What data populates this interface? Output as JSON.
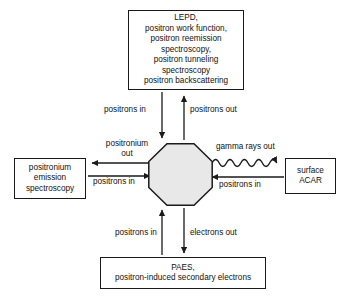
{
  "diagram": {
    "center": {
      "shape": "octagon",
      "label": "",
      "fill": "#e8e8e8",
      "stroke": "#1a1a1a"
    },
    "boxes": {
      "top": {
        "name": "LEPD techniques box",
        "lines": [
          "LEPD,",
          "positron work function,",
          "positron reemission",
          "spectroscopy,",
          "positron tunneling",
          "spectroscopy",
          "positron backscattering"
        ]
      },
      "left": {
        "name": "Positronium emission spectroscopy box",
        "lines": [
          "positronium",
          "emission",
          "spectroscopy"
        ]
      },
      "right": {
        "name": "Surface ACAR box",
        "lines": [
          "surface",
          "ACAR"
        ]
      },
      "bottom": {
        "name": "PAES box",
        "lines": [
          "PAES,",
          "positron-induced secondary electrons"
        ]
      }
    },
    "arrow_labels": {
      "positrons_in_top": "positrons in",
      "positrons_out_top": "positrons out",
      "positronium_out": "positronium\nout",
      "positronium_out_line1": "positronium",
      "positronium_out_line2": "out",
      "positrons_in_left": "positrons in",
      "gamma_rays_out": "gamma rays out",
      "positrons_in_right": "positrons in",
      "positrons_in_bottom": "positrons in",
      "electrons_out_bottom": "electrons out"
    },
    "colors": {
      "stroke": "#1a1a1a",
      "text": "#111111",
      "background": "#ffffff",
      "octagon_fill": "#e8e8e8"
    }
  }
}
